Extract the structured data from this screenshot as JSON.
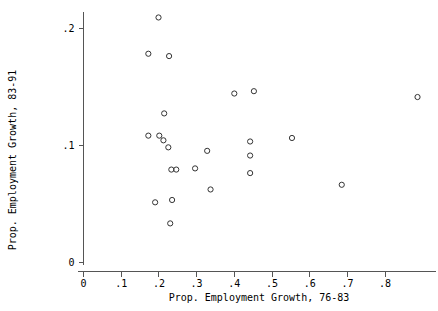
{
  "chart_data": {
    "type": "scatter",
    "title": "",
    "xlabel": "Prop. Employment Growth, 76-83",
    "ylabel": "Prop. Employment Growth, 83-91",
    "xlim": [
      0,
      0.9
    ],
    "ylim": [
      0,
      0.215
    ],
    "grid": false,
    "legend": null,
    "marker": "open-circle",
    "xticks": [
      0,
      0.1,
      0.2,
      0.3,
      0.4,
      0.5,
      0.6,
      0.7,
      0.8
    ],
    "xticklabels": [
      "0",
      ".1",
      ".2",
      ".3",
      ".4",
      ".5",
      ".6",
      ".7",
      ".8"
    ],
    "yticks": [
      0,
      0.1,
      0.2
    ],
    "yticklabels": [
      "0",
      ".1",
      ".2"
    ],
    "points": [
      {
        "x": 0.199,
        "y": 0.209
      },
      {
        "x": 0.172,
        "y": 0.178
      },
      {
        "x": 0.227,
        "y": 0.176
      },
      {
        "x": 0.214,
        "y": 0.127
      },
      {
        "x": 0.172,
        "y": 0.108
      },
      {
        "x": 0.201,
        "y": 0.108
      },
      {
        "x": 0.212,
        "y": 0.104
      },
      {
        "x": 0.225,
        "y": 0.098
      },
      {
        "x": 0.233,
        "y": 0.079
      },
      {
        "x": 0.246,
        "y": 0.079
      },
      {
        "x": 0.296,
        "y": 0.08
      },
      {
        "x": 0.328,
        "y": 0.095
      },
      {
        "x": 0.337,
        "y": 0.062
      },
      {
        "x": 0.19,
        "y": 0.051
      },
      {
        "x": 0.235,
        "y": 0.053
      },
      {
        "x": 0.23,
        "y": 0.033
      },
      {
        "x": 0.4,
        "y": 0.144
      },
      {
        "x": 0.452,
        "y": 0.146
      },
      {
        "x": 0.442,
        "y": 0.103
      },
      {
        "x": 0.442,
        "y": 0.091
      },
      {
        "x": 0.442,
        "y": 0.076
      },
      {
        "x": 0.553,
        "y": 0.106
      },
      {
        "x": 0.685,
        "y": 0.066
      },
      {
        "x": 0.886,
        "y": 0.141
      }
    ]
  }
}
